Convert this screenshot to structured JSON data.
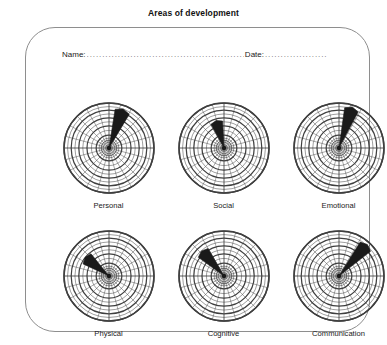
{
  "page": {
    "title": "Areas of development",
    "background_color": "#ffffff",
    "frame_border_color": "#8e8e8e"
  },
  "form": {
    "name_label": "Name:",
    "name_value": "",
    "name_dots": "....................................................................................",
    "date_label": "Date:",
    "date_value": "",
    "date_dots": "...................."
  },
  "chart_data": {
    "type": "radar",
    "title": "Areas of development",
    "grid": true,
    "rings": 10,
    "spokes": 24,
    "value_range": [
      0,
      10
    ],
    "line_color": "#3f3f3f",
    "wedge_color": "#1a1a1a",
    "charts": [
      {
        "label": "Personal",
        "wedge_angle_deg": 20,
        "wedge_width_deg": 22,
        "wedge_value": 8.4
      },
      {
        "label": "Social",
        "wedge_angle_deg": -16,
        "wedge_width_deg": 26,
        "wedge_value": 5.2
      },
      {
        "label": "Emotional",
        "wedge_angle_deg": 18,
        "wedge_width_deg": 20,
        "wedge_value": 8.8
      },
      {
        "label": "Physical",
        "wedge_angle_deg": -52,
        "wedge_width_deg": 26,
        "wedge_value": 5.6
      },
      {
        "label": "Cognitive",
        "wedge_angle_deg": -42,
        "wedge_width_deg": 24,
        "wedge_value": 6.4
      },
      {
        "label": "Communication",
        "wedge_angle_deg": 42,
        "wedge_width_deg": 20,
        "wedge_value": 8.6
      }
    ]
  }
}
